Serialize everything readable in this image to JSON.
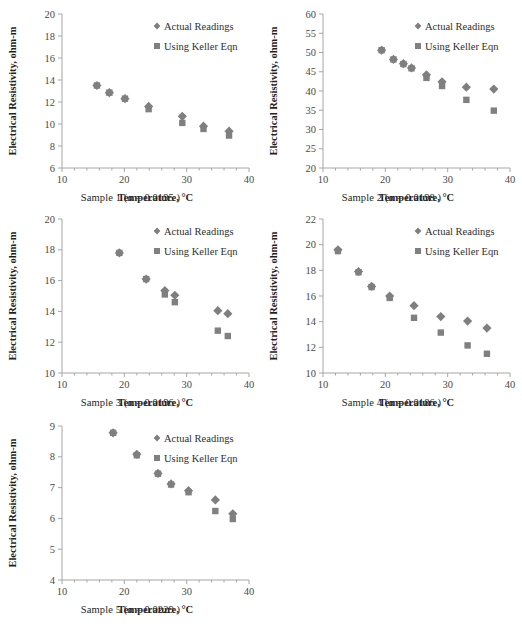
{
  "figure": {
    "panel_count": 5,
    "shared_xlabel": "Temperature, °C",
    "shared_ylabel": "Electrical Resistivity, ohm-m",
    "series_names": [
      "Actual Readings",
      "Using Keller Eqn"
    ],
    "colors": {
      "actual": "#7f7f7f",
      "keller": "#808080",
      "axis": "#a6a6a6",
      "text": "#333333"
    }
  },
  "chart_data": [
    {
      "type": "scatter",
      "id": "sample-1",
      "title": "",
      "caption": "Sample 1 (α = 0.0195 )",
      "xlabel": "Temperature, °C",
      "ylabel": "Electrical Resistivity, ohm-m",
      "xlim": [
        10,
        40
      ],
      "ylim": [
        6,
        20
      ],
      "xticks": [
        10,
        20,
        30,
        40
      ],
      "yticks": [
        6,
        8,
        10,
        12,
        14,
        16,
        18,
        20
      ],
      "xtick_labels": [
        "10",
        "20",
        "30",
        "40"
      ],
      "ytick_labels": [
        "6",
        "8",
        "10",
        "12",
        "14",
        "16",
        "18",
        "20"
      ],
      "grid": false,
      "legend_position": "top-right",
      "series": [
        {
          "name": "Actual Readings",
          "marker": "diamond",
          "points": [
            {
              "x": 15.6,
              "y": 13.5
            },
            {
              "x": 17.6,
              "y": 12.85
            },
            {
              "x": 20.1,
              "y": 12.3
            },
            {
              "x": 23.9,
              "y": 11.6
            },
            {
              "x": 29.3,
              "y": 10.7
            },
            {
              "x": 32.7,
              "y": 9.8
            },
            {
              "x": 36.8,
              "y": 9.35
            }
          ]
        },
        {
          "name": "Using Keller Eqn",
          "marker": "square",
          "points": [
            {
              "x": 15.6,
              "y": 13.5
            },
            {
              "x": 17.6,
              "y": 12.85
            },
            {
              "x": 20.1,
              "y": 12.3
            },
            {
              "x": 23.9,
              "y": 11.35
            },
            {
              "x": 29.3,
              "y": 10.1
            },
            {
              "x": 32.7,
              "y": 9.55
            },
            {
              "x": 36.8,
              "y": 8.95
            }
          ]
        }
      ]
    },
    {
      "type": "scatter",
      "id": "sample-2",
      "title": "",
      "caption": "Sample 2 (α = 0.0198 )",
      "xlabel": "Temperature, °C",
      "ylabel": "Electrical Resistivity, ohm-m",
      "xlim": [
        10,
        40
      ],
      "ylim": [
        20,
        60
      ],
      "xticks": [
        10,
        20,
        30,
        40
      ],
      "yticks": [
        20,
        25,
        30,
        35,
        40,
        45,
        50,
        55,
        60
      ],
      "xtick_labels": [
        "10",
        "20",
        "30",
        "40"
      ],
      "ytick_labels": [
        "20",
        "25",
        "30",
        "35",
        "40",
        "45",
        "50",
        "55",
        "60"
      ],
      "grid": false,
      "legend_position": "top-right",
      "series": [
        {
          "name": "Actual Readings",
          "marker": "diamond",
          "points": [
            {
              "x": 19.4,
              "y": 50.6
            },
            {
              "x": 21.3,
              "y": 48.2
            },
            {
              "x": 22.9,
              "y": 47.1
            },
            {
              "x": 24.2,
              "y": 46.0
            },
            {
              "x": 26.6,
              "y": 44.2
            },
            {
              "x": 29.1,
              "y": 42.4
            },
            {
              "x": 33.0,
              "y": 41.0
            },
            {
              "x": 37.4,
              "y": 40.5
            }
          ]
        },
        {
          "name": "Using Keller Eqn",
          "marker": "square",
          "points": [
            {
              "x": 19.4,
              "y": 50.6
            },
            {
              "x": 21.3,
              "y": 48.2
            },
            {
              "x": 22.9,
              "y": 47.0
            },
            {
              "x": 24.2,
              "y": 45.9
            },
            {
              "x": 26.6,
              "y": 43.4
            },
            {
              "x": 29.1,
              "y": 41.3
            },
            {
              "x": 33.0,
              "y": 37.7
            },
            {
              "x": 37.4,
              "y": 34.9
            }
          ]
        }
      ]
    },
    {
      "type": "scatter",
      "id": "sample-3",
      "title": "",
      "caption": "Sample 3 (α = 0.0196 )",
      "xlabel": "Temperature, °C",
      "ylabel": "Electrical Resistivity, ohm-m",
      "xlim": [
        10,
        40
      ],
      "ylim": [
        10,
        20
      ],
      "xticks": [
        10,
        20,
        30,
        40
      ],
      "yticks": [
        10,
        12,
        14,
        16,
        18,
        20
      ],
      "xtick_labels": [
        "10",
        "20",
        "30",
        "40"
      ],
      "ytick_labels": [
        "10",
        "12",
        "14",
        "16",
        "18",
        "20"
      ],
      "grid": false,
      "legend_position": "top-right",
      "series": [
        {
          "name": "Actual Readings",
          "marker": "diamond",
          "points": [
            {
              "x": 19.2,
              "y": 17.8
            },
            {
              "x": 23.5,
              "y": 16.1
            },
            {
              "x": 26.5,
              "y": 15.35
            },
            {
              "x": 28.1,
              "y": 15.05
            },
            {
              "x": 35.0,
              "y": 14.05
            },
            {
              "x": 36.6,
              "y": 13.85
            }
          ]
        },
        {
          "name": "Using Keller Eqn",
          "marker": "square",
          "points": [
            {
              "x": 19.2,
              "y": 17.8
            },
            {
              "x": 23.5,
              "y": 16.1
            },
            {
              "x": 26.5,
              "y": 15.1
            },
            {
              "x": 28.1,
              "y": 14.6
            },
            {
              "x": 35.0,
              "y": 12.75
            },
            {
              "x": 36.6,
              "y": 12.4
            }
          ]
        }
      ]
    },
    {
      "type": "scatter",
      "id": "sample-4",
      "title": "",
      "caption": "Sample 4 (α = 0.0186 )",
      "xlabel": "Temperature, °C",
      "ylabel": "Electrical Resistivity, ohm-m",
      "xlim": [
        10,
        40
      ],
      "ylim": [
        10,
        22
      ],
      "xticks": [
        10,
        20,
        30,
        40
      ],
      "yticks": [
        10,
        12,
        14,
        16,
        18,
        20,
        22
      ],
      "xtick_labels": [
        "10",
        "20",
        "30",
        "40"
      ],
      "ytick_labels": [
        "10",
        "12",
        "14",
        "16",
        "18",
        "20",
        "22"
      ],
      "grid": false,
      "legend_position": "top-right",
      "series": [
        {
          "name": "Actual Readings",
          "marker": "diamond",
          "points": [
            {
              "x": 12.4,
              "y": 19.6
            },
            {
              "x": 15.7,
              "y": 17.9
            },
            {
              "x": 17.8,
              "y": 16.75
            },
            {
              "x": 20.7,
              "y": 16.0
            },
            {
              "x": 24.6,
              "y": 15.25
            },
            {
              "x": 28.9,
              "y": 14.4
            },
            {
              "x": 33.2,
              "y": 14.05
            },
            {
              "x": 36.3,
              "y": 13.5
            }
          ]
        },
        {
          "name": "Using Keller Eqn",
          "marker": "square",
          "points": [
            {
              "x": 12.4,
              "y": 19.5
            },
            {
              "x": 15.7,
              "y": 17.85
            },
            {
              "x": 17.8,
              "y": 16.7
            },
            {
              "x": 20.7,
              "y": 15.85
            },
            {
              "x": 24.6,
              "y": 14.3
            },
            {
              "x": 28.9,
              "y": 13.15
            },
            {
              "x": 33.2,
              "y": 12.15
            },
            {
              "x": 36.3,
              "y": 11.5
            }
          ]
        }
      ]
    },
    {
      "type": "scatter",
      "id": "sample-5",
      "title": "",
      "caption": "Sample 5 (α = 0.0229 )",
      "xlabel": "Temperature, °C",
      "ylabel": "Electrical Resistivity, ohm-m",
      "xlim": [
        10,
        40
      ],
      "ylim": [
        4,
        9
      ],
      "xticks": [
        10,
        20,
        30,
        40
      ],
      "yticks": [
        4,
        5,
        6,
        7,
        8,
        9
      ],
      "xtick_labels": [
        "10",
        "20",
        "30",
        "40"
      ],
      "ytick_labels": [
        "4",
        "5",
        "6",
        "7",
        "8",
        "9"
      ],
      "grid": false,
      "legend_position": "top-right",
      "series": [
        {
          "name": "Actual Readings",
          "marker": "diamond",
          "points": [
            {
              "x": 18.2,
              "y": 8.78
            },
            {
              "x": 22.0,
              "y": 8.08
            },
            {
              "x": 25.4,
              "y": 7.46
            },
            {
              "x": 27.5,
              "y": 7.12
            },
            {
              "x": 30.3,
              "y": 6.9
            },
            {
              "x": 34.6,
              "y": 6.6
            },
            {
              "x": 37.4,
              "y": 6.15
            }
          ]
        },
        {
          "name": "Using Keller Eqn",
          "marker": "square",
          "points": [
            {
              "x": 18.2,
              "y": 8.78
            },
            {
              "x": 22.0,
              "y": 8.05
            },
            {
              "x": 25.4,
              "y": 7.45
            },
            {
              "x": 27.5,
              "y": 7.1
            },
            {
              "x": 30.3,
              "y": 6.85
            },
            {
              "x": 34.6,
              "y": 6.24
            },
            {
              "x": 37.4,
              "y": 5.98
            }
          ]
        }
      ]
    }
  ]
}
